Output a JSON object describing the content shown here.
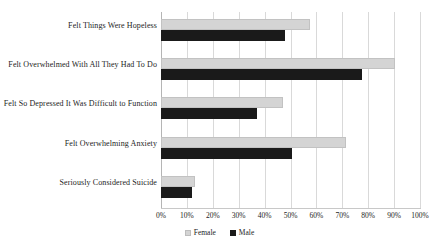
{
  "chart_data": {
    "type": "bar",
    "orientation": "horizontal",
    "title": "",
    "xlabel": "",
    "ylabel": "",
    "xlim": [
      0,
      100
    ],
    "xtick_labels": [
      "0%",
      "10%",
      "20%",
      "30%",
      "40%",
      "50%",
      "60%",
      "70%",
      "80%",
      "90%",
      "100%"
    ],
    "xtick_values": [
      0,
      10,
      20,
      30,
      40,
      50,
      60,
      70,
      80,
      90,
      100
    ],
    "grid": true,
    "legend_position": "bottom",
    "categories": [
      "Felt Things Were Hopeless",
      "Felt Overwhelmed With All They Had To Do",
      "Felt So Depressed It Was Difficult to Function",
      "Felt Overwhelming Anxiety",
      "Seriously Considered Suicide"
    ],
    "series": [
      {
        "name": "Female",
        "color": "#d4d4d4",
        "values": [
          57.5,
          90.5,
          47.0,
          71.5,
          13.0
        ]
      },
      {
        "name": "Male",
        "color": "#1a1a1a",
        "values": [
          48.0,
          77.5,
          37.0,
          50.5,
          12.0
        ]
      }
    ]
  },
  "legend": {
    "items": [
      {
        "label": "Female",
        "swatch": "female"
      },
      {
        "label": "Male",
        "swatch": "male"
      }
    ]
  }
}
